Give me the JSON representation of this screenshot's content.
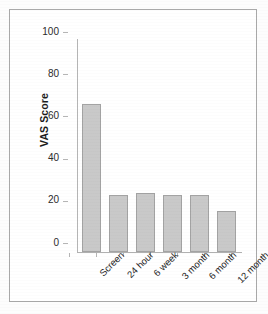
{
  "chart_data": {
    "type": "bar",
    "title": "",
    "xlabel": "",
    "ylabel": "VAS Score",
    "categories": [
      "Screen",
      "24 hour",
      "6 week",
      "3 month",
      "6 month",
      "12 month"
    ],
    "values": [
      70,
      27,
      28,
      27,
      27,
      19.5
    ],
    "ylim": [
      0,
      100
    ],
    "yticks": [
      "0",
      "20",
      "40",
      "60",
      "80",
      "100"
    ],
    "ytick_values": [
      0,
      20,
      40,
      60,
      80,
      100
    ],
    "grid": false,
    "legend": false,
    "legend_position": "none",
    "series": [
      {
        "name": "VAS Score",
        "values": [
          70,
          27,
          28,
          27,
          27,
          19.5
        ]
      }
    ],
    "colors": {
      "bar_fill": "#c9c9c9",
      "bar_border": "#a3a3a3",
      "axis": "#b5b5b5",
      "text": "#1f1f1f",
      "frame": "#a9a9a9",
      "background": "#ffffff"
    }
  }
}
